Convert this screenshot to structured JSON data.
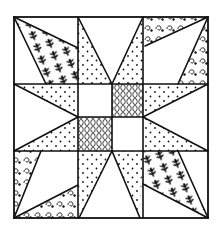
{
  "colors": {
    "background": "#ffffff",
    "line": "#111111",
    "print": "#111111"
  },
  "block": {
    "grid_x": [
      14,
      78,
      112,
      143,
      208
    ],
    "grid_y": [
      17,
      84,
      117,
      151,
      218
    ],
    "stroke_width": 1.6
  },
  "fabrics": {
    "dots": "dot-print",
    "leaf": "leaf-print",
    "curl": "curl-print",
    "oval": "oval-print"
  },
  "patches": [
    {
      "name": "tl-leaf-patch",
      "fabric": "leaf",
      "points": "14,17 78,48 78,84 46,84"
    },
    {
      "name": "tr-curl-top-patch",
      "fabric": "curl",
      "points": "143,17 208,17 145,46"
    },
    {
      "name": "tr-curl-side-patch",
      "fabric": "curl",
      "points": "208,17 208,84 178,84"
    },
    {
      "name": "bl-curl-side-patch",
      "fabric": "curl",
      "points": "14,151 41,151 14,218"
    },
    {
      "name": "bl-curl-bottom-patch",
      "fabric": "curl",
      "points": "14,218 78,185 78,218"
    },
    {
      "name": "br-leaf-patch",
      "fabric": "leaf",
      "points": "143,151 178,151 208,218 143,184"
    },
    {
      "name": "top-star-point-left",
      "fabric": "dots",
      "points": "78,17 112,84 78,84"
    },
    {
      "name": "top-star-point-right",
      "fabric": "dots",
      "points": "143,17 112,84 143,84"
    },
    {
      "name": "bottom-star-point-left",
      "fabric": "dots",
      "points": "78,151 112,151 79,218"
    },
    {
      "name": "bottom-star-point-right",
      "fabric": "dots",
      "points": "112,151 143,151 140,218"
    },
    {
      "name": "left-star-point-top",
      "fabric": "dots",
      "points": "14,84 78,84 78,117"
    },
    {
      "name": "left-star-point-bottom",
      "fabric": "dots",
      "points": "14,151 78,151 78,117"
    },
    {
      "name": "right-star-point-top",
      "fabric": "dots",
      "points": "143,84 208,84 143,117"
    },
    {
      "name": "right-star-point-bottom",
      "fabric": "dots",
      "points": "143,151 208,151 143,117"
    },
    {
      "name": "center-square-top-right",
      "fabric": "oval",
      "points": "112,84 143,84 143,117 112,117"
    },
    {
      "name": "center-square-bottom-left",
      "fabric": "oval",
      "points": "78,117 112,117 112,151 78,151"
    }
  ],
  "lines": [
    "78,17 78,218",
    "143,17 143,218",
    "14,84 208,84",
    "14,151 208,151",
    "112,84 112,151",
    "78,117 143,117",
    "14,17 78,48",
    "14,17 46,84",
    "208,17 145,46",
    "208,17 178,84",
    "41,151 14,218",
    "14,218 78,185",
    "178,151 208,218",
    "143,184 208,218",
    "78,17 112,84",
    "143,17 112,84",
    "112,151 79,218",
    "112,151 140,218",
    "14,84 78,117",
    "14,151 78,117",
    "208,84 143,117",
    "208,151 143,117"
  ]
}
